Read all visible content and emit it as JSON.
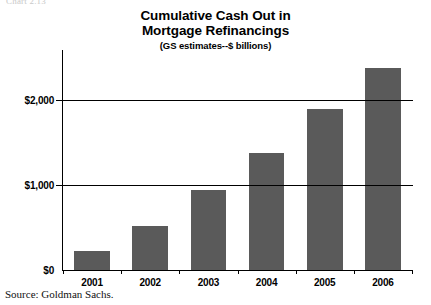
{
  "chart_number": "Chart 2.13",
  "title": {
    "line1": "Cumulative Cash Out in",
    "line2": "Mortgage Refinancings",
    "subtitle": "(GS estimates--$ billions)"
  },
  "source": "Source: Goldman Sachs.",
  "colors": {
    "bar_fill": "#5a5a5a",
    "axis": "#000000",
    "background": "#ffffff"
  },
  "chart_data": {
    "type": "bar",
    "title": "Cumulative Cash Out in Mortgage Refinancings",
    "subtitle": "(GS estimates--$ billions)",
    "xlabel": "",
    "ylabel": "",
    "categories": [
      "2001",
      "2002",
      "2003",
      "2004",
      "2005",
      "2006"
    ],
    "values": [
      220,
      520,
      940,
      1380,
      1900,
      2380
    ],
    "ylim": [
      0,
      2500
    ],
    "ytick_values": [
      0,
      1000,
      2000
    ],
    "ytick_labels": [
      "$0",
      "$1,000",
      "$2,000"
    ],
    "grid": true,
    "legend": false,
    "source": "Source: Goldman Sachs."
  }
}
